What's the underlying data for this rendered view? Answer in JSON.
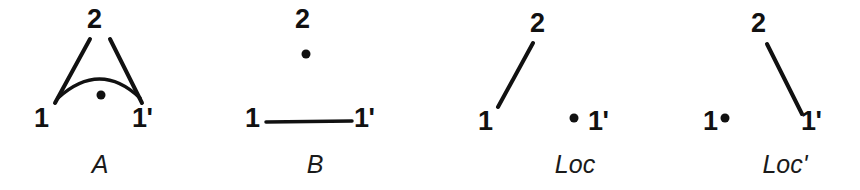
{
  "figure": {
    "background_color": "#ffffff",
    "ink_color": "#111111",
    "panels": [
      {
        "id": "panel-a",
        "caption": "A",
        "nodes": [
          {
            "name": "node-2",
            "label": "2"
          },
          {
            "name": "node-1",
            "label": "1"
          },
          {
            "name": "node-1-prime",
            "label": "1'"
          }
        ],
        "edges": [
          {
            "name": "edge-1-to-2",
            "from": "1",
            "to": "2"
          },
          {
            "name": "edge-2-to-1-prime",
            "from": "2",
            "to": "1'"
          },
          {
            "name": "arc-1-to-1-prime",
            "from": "1",
            "to": "1'"
          }
        ],
        "dots": [
          {
            "name": "dot-under-arc"
          }
        ]
      },
      {
        "id": "panel-b",
        "caption": "B",
        "nodes": [
          {
            "name": "node-2",
            "label": "2"
          },
          {
            "name": "node-1",
            "label": "1"
          },
          {
            "name": "node-1-prime",
            "label": "1'"
          }
        ],
        "edges": [
          {
            "name": "edge-1-to-1-prime",
            "from": "1",
            "to": "1'"
          }
        ],
        "dots": [
          {
            "name": "dot-under-2"
          }
        ]
      },
      {
        "id": "panel-loc",
        "caption": "Loc",
        "nodes": [
          {
            "name": "node-2",
            "label": "2"
          },
          {
            "name": "node-1",
            "label": "1"
          },
          {
            "name": "node-1-prime",
            "label": "1'"
          }
        ],
        "edges": [
          {
            "name": "edge-1-to-2",
            "from": "1",
            "to": "2"
          }
        ],
        "dots": [
          {
            "name": "dot-left-of-1-prime"
          }
        ]
      },
      {
        "id": "panel-loc-prime",
        "caption": "Loc'",
        "nodes": [
          {
            "name": "node-2",
            "label": "2"
          },
          {
            "name": "node-1",
            "label": "1"
          },
          {
            "name": "node-1-prime",
            "label": "1'"
          }
        ],
        "edges": [
          {
            "name": "edge-2-to-1-prime",
            "from": "2",
            "to": "1'"
          }
        ],
        "dots": [
          {
            "name": "dot-right-of-1"
          }
        ]
      }
    ]
  }
}
